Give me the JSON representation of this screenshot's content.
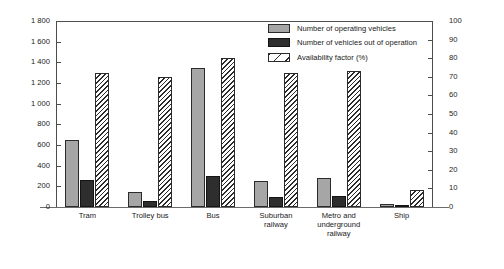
{
  "chart_data": {
    "type": "bar",
    "title": "",
    "subtitle": "",
    "xlabel": "",
    "ylabel": "",
    "categories": [
      "Tram",
      "Trolley bus",
      "Bus",
      "Suburban railway",
      "Metro and underground railway",
      "Ship"
    ],
    "category_label_lines": [
      [
        "Tram"
      ],
      [
        "Trolley bus"
      ],
      [
        "Bus"
      ],
      [
        "Suburban",
        "railway"
      ],
      [
        "Metro and",
        "underground",
        "railway"
      ],
      [
        "Ship"
      ]
    ],
    "series": [
      {
        "name": "Number of operating vehicles",
        "axis": "left",
        "style": "solid-gray",
        "color": "#a6a6a6",
        "values": [
          650,
          145,
          1350,
          255,
          285,
          30
        ]
      },
      {
        "name": "Number of vehicles out of operation",
        "axis": "left",
        "style": "solid-dark",
        "color": "#2e2e2e",
        "values": [
          265,
          55,
          300,
          95,
          105,
          15
        ]
      },
      {
        "name": "Availability factor (%)",
        "axis": "right",
        "style": "hatched",
        "color": "#ffffff",
        "values": [
          72,
          70,
          80,
          72,
          73,
          9
        ]
      }
    ],
    "left_axis": {
      "min": 0,
      "max": 1800,
      "step": 200,
      "ticks": [
        0,
        200,
        400,
        600,
        800,
        1000,
        1200,
        1400,
        1600,
        1800
      ],
      "tick_labels": [
        "0",
        "200",
        "400",
        "600",
        "800",
        "1 000",
        "1 200",
        "1 400",
        "1 600",
        "1 800"
      ]
    },
    "right_axis": {
      "min": 0,
      "max": 100,
      "step": 10,
      "ticks": [
        0,
        10,
        20,
        30,
        40,
        50,
        60,
        70,
        80,
        90,
        100
      ],
      "tick_labels": [
        "0",
        "10",
        "20",
        "30",
        "40",
        "50",
        "60",
        "70",
        "80",
        "90",
        "100"
      ]
    },
    "grid": false,
    "legend_position": "top-right-inside"
  },
  "legend": {
    "entries": [
      {
        "label": "Number of operating vehicles",
        "swatch": "solid-gray"
      },
      {
        "label": "Number of vehicles out of operation",
        "swatch": "solid-dark"
      },
      {
        "label": "Availability factor (%)",
        "swatch": "hatched"
      }
    ]
  }
}
